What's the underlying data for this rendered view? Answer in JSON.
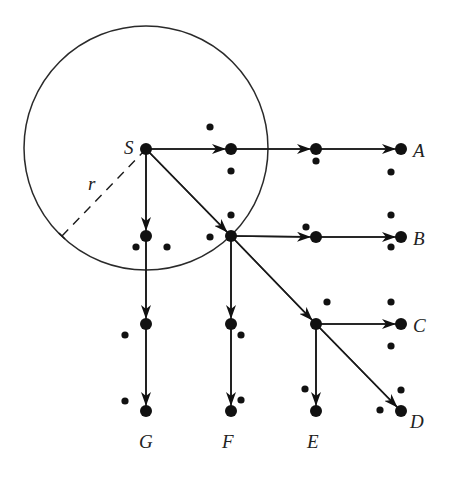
{
  "diagram": {
    "type": "search-graph",
    "circle": {
      "cx": 146,
      "cy": 148,
      "r": 122,
      "radius_label": "r"
    },
    "radius_line": {
      "x1": 146,
      "y1": 149,
      "x2": 62,
      "y2": 236
    },
    "radius_label_pos": {
      "x": 88,
      "y": 190
    },
    "source": {
      "id": "S",
      "label": "S",
      "x": 146,
      "y": 149,
      "label_x": 124,
      "label_y": 154
    },
    "nodes": [
      {
        "id": "n1",
        "x": 231,
        "y": 149
      },
      {
        "id": "n2",
        "x": 316,
        "y": 149
      },
      {
        "id": "A",
        "label": "A",
        "x": 401,
        "y": 149,
        "label_x": 413,
        "label_y": 157
      },
      {
        "id": "n3",
        "x": 231,
        "y": 236
      },
      {
        "id": "n4",
        "x": 316,
        "y": 237
      },
      {
        "id": "B",
        "label": "B",
        "x": 401,
        "y": 237,
        "label_x": 413,
        "label_y": 245
      },
      {
        "id": "n5",
        "x": 316,
        "y": 324
      },
      {
        "id": "C",
        "label": "C",
        "x": 401,
        "y": 324,
        "label_x": 413,
        "label_y": 332
      },
      {
        "id": "D",
        "label": "D",
        "x": 401,
        "y": 411,
        "label_x": 410,
        "label_y": 428
      },
      {
        "id": "n6",
        "x": 146,
        "y": 236
      },
      {
        "id": "n7",
        "x": 146,
        "y": 324
      },
      {
        "id": "G",
        "label": "G",
        "x": 146,
        "y": 411,
        "label_x": 139,
        "label_y": 448
      },
      {
        "id": "n8",
        "x": 231,
        "y": 324
      },
      {
        "id": "F",
        "label": "F",
        "x": 231,
        "y": 411,
        "label_x": 222,
        "label_y": 448
      },
      {
        "id": "E",
        "label": "E",
        "x": 316,
        "y": 411,
        "label_x": 307,
        "label_y": 448
      }
    ],
    "edges": [
      {
        "from": "S",
        "to": "n1"
      },
      {
        "from": "n1",
        "to": "n2"
      },
      {
        "from": "n2",
        "to": "A"
      },
      {
        "from": "S",
        "to": "n3"
      },
      {
        "from": "n3",
        "to": "n4"
      },
      {
        "from": "n4",
        "to": "B"
      },
      {
        "from": "n3",
        "to": "n5"
      },
      {
        "from": "n5",
        "to": "C"
      },
      {
        "from": "n5",
        "to": "D"
      },
      {
        "from": "n5",
        "to": "E"
      },
      {
        "from": "S",
        "to": "n6"
      },
      {
        "from": "n6",
        "to": "n7"
      },
      {
        "from": "n7",
        "to": "G"
      },
      {
        "from": "n3",
        "to": "n8"
      },
      {
        "from": "n8",
        "to": "F"
      }
    ],
    "small_dots": [
      {
        "x": 210,
        "y": 127
      },
      {
        "x": 231,
        "y": 171
      },
      {
        "x": 231,
        "y": 215
      },
      {
        "x": 210,
        "y": 237
      },
      {
        "x": 316,
        "y": 161
      },
      {
        "x": 306,
        "y": 227
      },
      {
        "x": 327,
        "y": 302
      },
      {
        "x": 305,
        "y": 389
      },
      {
        "x": 391,
        "y": 172
      },
      {
        "x": 391,
        "y": 215
      },
      {
        "x": 391,
        "y": 247
      },
      {
        "x": 391,
        "y": 302
      },
      {
        "x": 391,
        "y": 346
      },
      {
        "x": 401,
        "y": 390
      },
      {
        "x": 380,
        "y": 410
      },
      {
        "x": 136,
        "y": 247
      },
      {
        "x": 167,
        "y": 247
      },
      {
        "x": 125,
        "y": 335
      },
      {
        "x": 125,
        "y": 401
      },
      {
        "x": 241,
        "y": 335
      },
      {
        "x": 241,
        "y": 400
      }
    ],
    "node_radius": 6,
    "dot_radius": 3.6
  }
}
